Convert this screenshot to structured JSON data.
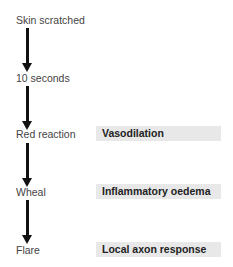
{
  "diagram": {
    "steps": [
      {
        "label": "Skin scratched"
      },
      {
        "label": "10 seconds"
      },
      {
        "label": "Red reaction"
      },
      {
        "label": "Wheal"
      },
      {
        "label": "Flare"
      }
    ],
    "annotations": [
      {
        "label": "Vasodilation",
        "step": "Red reaction"
      },
      {
        "label": "Inflammatory oedema",
        "step": "Wheal"
      },
      {
        "label": "Local axon response",
        "step": "Flare"
      }
    ],
    "colors": {
      "arrow": "#111111",
      "box_fill": "#e8e8e8",
      "step_text": "#444444",
      "box_text": "#222222"
    }
  }
}
